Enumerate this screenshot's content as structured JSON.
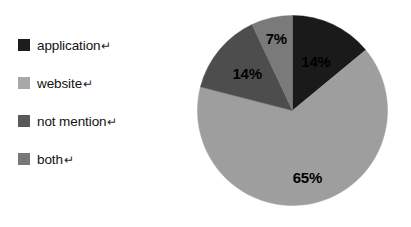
{
  "chart_data": {
    "type": "pie",
    "title": "",
    "categories": [
      "application",
      "website",
      "not mention",
      "both"
    ],
    "values": [
      14,
      65,
      14,
      7
    ],
    "value_labels": [
      "14%",
      "65%",
      "14%",
      "7%"
    ],
    "units": "percent",
    "start_angle_deg": 0,
    "direction": "clockwise",
    "legend_position": "left",
    "grid": false,
    "colors": [
      "#1a1a1a",
      "#9e9e9e",
      "#4d4d4d",
      "#7a7a7a"
    ],
    "slices": [
      {
        "label": "application",
        "value": 14,
        "value_label": "14%",
        "color": "#1a1a1a",
        "label_color": "#000000"
      },
      {
        "label": "website",
        "value": 65,
        "value_label": "65%",
        "color": "#9e9e9e",
        "label_color": "#000000"
      },
      {
        "label": "not mention",
        "value": 14,
        "value_label": "14%",
        "color": "#4d4d4d",
        "label_color": "#000000"
      },
      {
        "label": "both",
        "value": 7,
        "value_label": "7%",
        "color": "#7a7a7a",
        "label_color": "#000000"
      }
    ]
  },
  "legend": {
    "items": [
      {
        "label": "application",
        "mark": "↵",
        "color": "#1c1c1c"
      },
      {
        "label": "website",
        "mark": "↵",
        "color": "#a8a8a8"
      },
      {
        "label": "not mention",
        "mark": "↵",
        "color": "#595959"
      },
      {
        "label": "both",
        "mark": "↵",
        "color": "#787878"
      }
    ]
  },
  "canvas": {
    "background": "#ffffff"
  }
}
